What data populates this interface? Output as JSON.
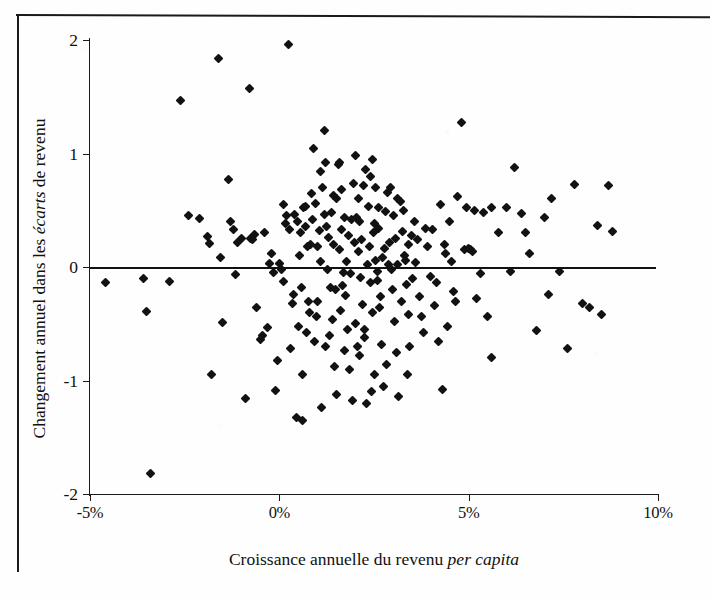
{
  "chart_data": {
    "type": "scatter",
    "title": "",
    "xlabel": "Croissance annuelle du revenu per capita",
    "xlabel_plain": "Croissance annuelle du revenu ",
    "xlabel_italic": "per capita",
    "ylabel": "Changement annuel dans les écarts de revenu",
    "ylabel_plain_1": "Changement annuel dans les ",
    "ylabel_italic": "écarts",
    "ylabel_plain_2": " de revenu",
    "xlim": [
      -5,
      10
    ],
    "ylim": [
      -2,
      2
    ],
    "xticks": [
      -5,
      0,
      5,
      10
    ],
    "xticklabels": [
      "-5%",
      "0%",
      "5%",
      "10%"
    ],
    "yticks": [
      2,
      1,
      0,
      -1,
      -2
    ],
    "yticklabels": [
      "2",
      "1",
      "0",
      "-1",
      "-2"
    ],
    "grid": false,
    "legend": null,
    "reference_line": {
      "axis": "y",
      "value": 0,
      "style": "solid"
    },
    "marker": "diamond",
    "marker_color": "#121212",
    "n_points": 231,
    "points": [
      [
        -4.6,
        -0.14
      ],
      [
        -3.6,
        -0.1
      ],
      [
        -3.5,
        -0.39
      ],
      [
        -3.4,
        -1.82
      ],
      [
        -2.9,
        -0.13
      ],
      [
        -2.6,
        1.47
      ],
      [
        -2.4,
        0.45
      ],
      [
        -2.1,
        0.43
      ],
      [
        -1.9,
        0.27
      ],
      [
        -1.85,
        0.21
      ],
      [
        -1.8,
        -0.95
      ],
      [
        -1.6,
        1.84
      ],
      [
        -1.55,
        0.08
      ],
      [
        -1.5,
        -0.49
      ],
      [
        -1.35,
        0.77
      ],
      [
        -1.3,
        0.4
      ],
      [
        -1.2,
        0.33
      ],
      [
        -1.15,
        -0.07
      ],
      [
        -1.1,
        0.22
      ],
      [
        -1.0,
        0.25
      ],
      [
        -0.9,
        -1.16
      ],
      [
        -0.8,
        1.57
      ],
      [
        -0.75,
        0.25
      ],
      [
        -0.7,
        0.24
      ],
      [
        -0.65,
        0.29
      ],
      [
        -0.6,
        -0.36
      ],
      [
        -0.5,
        -0.64
      ],
      [
        -0.45,
        -0.6
      ],
      [
        -0.4,
        0.3
      ],
      [
        -0.3,
        -0.53
      ],
      [
        -0.2,
        0.12
      ],
      [
        -0.15,
        -0.05
      ],
      [
        -0.1,
        -1.09
      ],
      [
        -0.05,
        -0.82
      ],
      [
        0.0,
        0.03
      ],
      [
        0.05,
        -0.02
      ],
      [
        0.1,
        -0.13
      ],
      [
        0.15,
        0.38
      ],
      [
        0.2,
        0.45
      ],
      [
        0.25,
        1.96
      ],
      [
        0.3,
        -0.72
      ],
      [
        0.35,
        -0.32
      ],
      [
        0.4,
        0.46
      ],
      [
        0.45,
        -1.33
      ],
      [
        0.5,
        -0.52
      ],
      [
        0.55,
        0.3
      ],
      [
        0.6,
        -1.35
      ],
      [
        0.65,
        0.52
      ],
      [
        0.7,
        0.53
      ],
      [
        0.75,
        0.18
      ],
      [
        0.8,
        -0.4
      ],
      [
        0.85,
        0.65
      ],
      [
        0.9,
        1.04
      ],
      [
        0.95,
        0.56
      ],
      [
        1.0,
        -0.3
      ],
      [
        1.05,
        0.32
      ],
      [
        1.1,
        0.84
      ],
      [
        1.15,
        0.7
      ],
      [
        1.2,
        1.2
      ],
      [
        1.25,
        0.36
      ],
      [
        1.3,
        0.26
      ],
      [
        1.35,
        -0.18
      ],
      [
        1.4,
        -0.46
      ],
      [
        1.45,
        -0.88
      ],
      [
        1.5,
        0.6
      ],
      [
        1.55,
        0.9
      ],
      [
        1.6,
        0.92
      ],
      [
        1.65,
        0.33
      ],
      [
        1.7,
        -0.05
      ],
      [
        1.75,
        -0.25
      ],
      [
        1.8,
        -0.55
      ],
      [
        1.85,
        -0.9
      ],
      [
        1.9,
        0.42
      ],
      [
        1.95,
        0.74
      ],
      [
        2.0,
        0.98
      ],
      [
        2.05,
        0.44
      ],
      [
        2.1,
        0.14
      ],
      [
        2.15,
        -0.09
      ],
      [
        2.2,
        -0.33
      ],
      [
        2.25,
        -0.62
      ],
      [
        2.3,
        -1.2
      ],
      [
        2.35,
        0.53
      ],
      [
        2.4,
        0.8
      ],
      [
        2.45,
        0.95
      ],
      [
        2.5,
        0.38
      ],
      [
        2.55,
        0.06
      ],
      [
        2.6,
        -0.12
      ],
      [
        2.65,
        -0.36
      ],
      [
        2.7,
        -0.68
      ],
      [
        2.75,
        -1.05
      ],
      [
        2.8,
        0.49
      ],
      [
        2.85,
        0.66
      ],
      [
        2.9,
        0.22
      ],
      [
        2.95,
        -0.02
      ],
      [
        3.0,
        -0.2
      ],
      [
        3.05,
        -0.48
      ],
      [
        3.1,
        -0.75
      ],
      [
        3.15,
        -1.14
      ],
      [
        3.2,
        0.58
      ],
      [
        3.25,
        0.31
      ],
      [
        3.3,
        0.1
      ],
      [
        3.35,
        -0.15
      ],
      [
        3.4,
        -0.42
      ],
      [
        3.45,
        -0.7
      ],
      [
        3.5,
        0.28
      ],
      [
        3.6,
        0.04
      ],
      [
        3.7,
        -0.26
      ],
      [
        3.8,
        -0.58
      ],
      [
        3.9,
        0.18
      ],
      [
        4.0,
        -0.08
      ],
      [
        4.1,
        -0.34
      ],
      [
        4.2,
        -0.66
      ],
      [
        4.3,
        -1.08
      ],
      [
        4.4,
        0.12
      ],
      [
        4.5,
        0.4
      ],
      [
        4.6,
        -0.22
      ],
      [
        4.7,
        0.62
      ],
      [
        4.8,
        1.27
      ],
      [
        4.9,
        0.15
      ],
      [
        5.0,
        0.16
      ],
      [
        5.05,
        0.15
      ],
      [
        5.1,
        0.14
      ],
      [
        5.2,
        -0.28
      ],
      [
        5.3,
        -0.06
      ],
      [
        5.4,
        0.48
      ],
      [
        5.5,
        -0.44
      ],
      [
        5.6,
        -0.8
      ],
      [
        5.8,
        0.3
      ],
      [
        6.0,
        0.52
      ],
      [
        6.2,
        0.88
      ],
      [
        6.4,
        0.47
      ],
      [
        6.6,
        0.12
      ],
      [
        6.8,
        -0.56
      ],
      [
        7.0,
        0.44
      ],
      [
        7.2,
        0.6
      ],
      [
        7.4,
        -0.04
      ],
      [
        7.6,
        -0.72
      ],
      [
        7.8,
        0.73
      ],
      [
        8.0,
        -0.32
      ],
      [
        8.2,
        -0.36
      ],
      [
        8.4,
        0.37
      ],
      [
        8.5,
        -0.42
      ],
      [
        8.7,
        0.72
      ],
      [
        8.8,
        0.31
      ],
      [
        -0.25,
        0.03
      ],
      [
        0.12,
        0.55
      ],
      [
        0.62,
        -0.95
      ],
      [
        1.02,
        0.18
      ],
      [
        1.22,
        -0.7
      ],
      [
        1.42,
        0.63
      ],
      [
        1.62,
        -0.38
      ],
      [
        1.82,
        0.28
      ],
      [
        2.02,
        -0.5
      ],
      [
        2.22,
        0.72
      ],
      [
        2.42,
        -0.14
      ],
      [
        2.62,
        0.34
      ],
      [
        2.82,
        -0.86
      ],
      [
        3.02,
        0.45
      ],
      [
        3.22,
        -0.3
      ],
      [
        3.42,
        0.2
      ],
      [
        1.12,
        -1.24
      ],
      [
        1.52,
        -1.12
      ],
      [
        2.12,
        -0.78
      ],
      [
        2.52,
        -0.95
      ],
      [
        0.72,
        -0.58
      ],
      [
        0.92,
        -0.66
      ],
      [
        1.32,
        -0.6
      ],
      [
        1.72,
        -0.74
      ],
      [
        2.32,
        0.02
      ],
      [
        2.72,
        0.08
      ],
      [
        3.12,
        0.02
      ],
      [
        3.52,
        -0.1
      ],
      [
        4.05,
        0.33
      ],
      [
        4.25,
        0.55
      ],
      [
        4.45,
        -0.52
      ],
      [
        4.65,
        -0.3
      ],
      [
        1.18,
        0.46
      ],
      [
        1.38,
        0.48
      ],
      [
        1.58,
        0.15
      ],
      [
        1.78,
        0.05
      ],
      [
        2.18,
        0.24
      ],
      [
        2.38,
        0.18
      ],
      [
        2.58,
        -0.04
      ],
      [
        2.78,
        0.16
      ],
      [
        0.52,
        0.1
      ],
      [
        0.82,
        0.2
      ],
      [
        1.08,
        0.05
      ],
      [
        1.28,
        -0.02
      ],
      [
        2.08,
        0.6
      ],
      [
        2.28,
        0.86
      ],
      [
        2.48,
        0.3
      ],
      [
        2.88,
        0.02
      ],
      [
        3.08,
        0.25
      ],
      [
        3.28,
        0.5
      ],
      [
        3.38,
        -0.95
      ],
      [
        3.58,
        0.4
      ],
      [
        0.38,
        -0.24
      ],
      [
        0.58,
        -0.18
      ],
      [
        0.78,
        -0.3
      ],
      [
        0.98,
        -0.44
      ],
      [
        1.48,
        -0.2
      ],
      [
        1.68,
        -0.16
      ],
      [
        1.88,
        -0.06
      ],
      [
        2.68,
        -0.26
      ],
      [
        4.35,
        0.2
      ],
      [
        4.55,
        0.05
      ],
      [
        4.95,
        0.52
      ],
      [
        5.15,
        0.5
      ],
      [
        1.93,
        -1.18
      ],
      [
        2.43,
        -1.1
      ],
      [
        0.28,
        0.33
      ],
      [
        0.48,
        0.4
      ],
      [
        1.98,
        0.22
      ],
      [
        2.06,
        -0.7
      ],
      [
        2.26,
        -0.55
      ],
      [
        2.46,
        -0.4
      ],
      [
        3.65,
        0.24
      ],
      [
        3.75,
        -0.44
      ],
      [
        3.85,
        0.34
      ],
      [
        4.15,
        -0.14
      ],
      [
        1.23,
        0.92
      ],
      [
        1.73,
        0.44
      ],
      [
        2.13,
        0.4
      ],
      [
        2.53,
        0.7
      ],
      [
        0.68,
        0.36
      ],
      [
        0.88,
        0.42
      ],
      [
        1.43,
        0.2
      ],
      [
        1.63,
        0.68
      ],
      [
        2.63,
        0.52
      ],
      [
        2.93,
        0.7
      ],
      [
        3.13,
        0.6
      ],
      [
        3.33,
        0.06
      ],
      [
        5.6,
        0.52
      ],
      [
        6.1,
        -0.04
      ],
      [
        6.5,
        0.3
      ],
      [
        7.1,
        -0.24
      ]
    ]
  }
}
